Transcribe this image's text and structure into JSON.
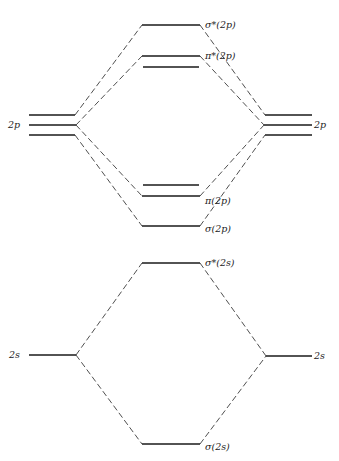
{
  "diagram": {
    "type": "molecular-orbital-energy-diagram",
    "labels": {
      "left_2p": "2p",
      "right_2p": "2p",
      "left_2s": "2s",
      "right_2s": "2s",
      "sigma_star_2p": "σ*(2p)",
      "pi_star_2p": "π*(2p)",
      "pi_2p": "π(2p)",
      "sigma_2p": "σ(2p)",
      "sigma_star_2s": "σ*(2s)",
      "sigma_2s": "σ(2s)"
    },
    "levels": [
      {
        "name": "sigma_star_2p",
        "y": 25,
        "degeneracy": 1
      },
      {
        "name": "pi_star_2p",
        "y": 56,
        "degeneracy": 2
      },
      {
        "name": "atomic_2p",
        "y": 125,
        "degeneracy": 3
      },
      {
        "name": "pi_2p",
        "y": 196,
        "degeneracy": 2
      },
      {
        "name": "sigma_2p",
        "y": 226,
        "degeneracy": 1
      },
      {
        "name": "sigma_star_2s",
        "y": 263,
        "degeneracy": 1
      },
      {
        "name": "atomic_2s",
        "y": 355,
        "degeneracy": 1
      },
      {
        "name": "sigma_2s",
        "y": 444,
        "degeneracy": 1
      }
    ]
  }
}
